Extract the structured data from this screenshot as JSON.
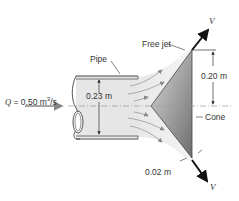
{
  "diagram": {
    "type": "fluid-mechanics-figure",
    "labels": {
      "flow_rate": "Q = 0.50 m³/s",
      "flow_rate_symbol": "Q",
      "flow_rate_value": "= 0.50 m",
      "flow_rate_units_sup": "3",
      "flow_rate_units_tail": "/s",
      "pipe": "Pipe",
      "pipe_diameter": "0.23 m",
      "free_jet": "Free jet",
      "cone_half_height": "0.20 m",
      "cone": "Cone",
      "jet_thickness": "0.02 m",
      "velocity_top": "V",
      "velocity_bottom": "V"
    },
    "colors": {
      "pipe_fill": "#e6e6e6",
      "outline": "#444444",
      "cone_dark": "#7a7a7a",
      "cone_light": "#d8d8d8",
      "jet_fill": "#eeeeee",
      "flow_arrow": "#888888",
      "velocity_arrow": "#111111",
      "centerline": "#999999"
    }
  }
}
